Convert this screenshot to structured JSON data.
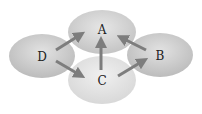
{
  "diagram": {
    "type": "directed-graph",
    "nodes": [
      {
        "id": "A",
        "label": "A",
        "cx": 102,
        "cy": 32,
        "rx": 34,
        "ry": 22,
        "fill_light": "#e4e4e4",
        "fill_dark": "#c2c2c2"
      },
      {
        "id": "D",
        "label": "D",
        "cx": 42,
        "cy": 56,
        "rx": 33,
        "ry": 22,
        "fill_light": "#e2e2e2",
        "fill_dark": "#bdbdbd"
      },
      {
        "id": "B",
        "label": "B",
        "cx": 160,
        "cy": 55,
        "rx": 33,
        "ry": 22,
        "fill_light": "#e2e2e2",
        "fill_dark": "#bdbdbd"
      },
      {
        "id": "C",
        "label": "C",
        "cx": 102,
        "cy": 80,
        "rx": 34,
        "ry": 24,
        "fill_light": "#eeeeee",
        "fill_dark": "#d6d6d6"
      }
    ],
    "edges": [
      {
        "from": "D",
        "to": "A",
        "x1": 56,
        "y1": 50,
        "x2": 82,
        "y2": 34
      },
      {
        "from": "D",
        "to": "C",
        "x1": 56,
        "y1": 61,
        "x2": 82,
        "y2": 76
      },
      {
        "from": "C",
        "to": "A",
        "x1": 101,
        "y1": 70,
        "x2": 101,
        "y2": 40
      },
      {
        "from": "C",
        "to": "B",
        "x1": 118,
        "y1": 76,
        "x2": 145,
        "y2": 60
      },
      {
        "from": "B",
        "to": "A",
        "x1": 146,
        "y1": 50,
        "x2": 120,
        "y2": 37
      }
    ],
    "colors": {
      "arrow": "#7d7d7d",
      "label": "#222222",
      "background": "#ffffff"
    }
  }
}
